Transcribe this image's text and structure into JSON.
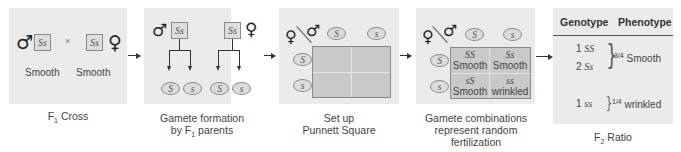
{
  "panels": {
    "f1_cross": {
      "caption_main": "F",
      "caption_sub": "1",
      "caption_rest": " Cross",
      "male_symbol": "♂",
      "female_symbol": "♀",
      "male_genotype": "Ss",
      "female_genotype": "Ss",
      "cross_sign": "×",
      "male_phenotype": "Smooth",
      "female_phenotype": "Smooth"
    },
    "gamete_formation": {
      "caption_line1": "Gamete formation",
      "caption_line2_pre": "by F",
      "caption_line2_sub": "1",
      "caption_line2_post": " parents",
      "male_symbol": "♂",
      "female_symbol": "♀",
      "male_genotype": "Ss",
      "female_genotype": "Ss",
      "male_gametes": [
        "S",
        "s"
      ],
      "female_gametes": [
        "S",
        "s"
      ]
    },
    "punnett_setup": {
      "caption_line1": "Set up",
      "caption_line2": "Punnett Square",
      "female_symbol": "♀",
      "male_symbol": "♂",
      "male_gametes": [
        "S",
        "s"
      ],
      "female_gametes": [
        "S",
        "s"
      ]
    },
    "gamete_combinations": {
      "caption_line1": "Gamete combinations",
      "caption_line2": "represent random",
      "caption_line3": "fertilization",
      "female_symbol": "♀",
      "male_symbol": "♂",
      "male_gametes": [
        "S",
        "s"
      ],
      "female_gametes": [
        "S",
        "s"
      ],
      "cells": [
        {
          "genotype": "SS",
          "phenotype": "Smooth"
        },
        {
          "genotype": "Ss",
          "phenotype": "Smooth"
        },
        {
          "genotype": "sS",
          "phenotype": "Smooth"
        },
        {
          "genotype": "ss",
          "phenotype": "wrinkled"
        }
      ]
    },
    "f2_ratio": {
      "caption_main": "F",
      "caption_sub": "2",
      "caption_rest": " Ratio",
      "headers": [
        "Genotype",
        "Phenotype"
      ],
      "rows": [
        {
          "count": "1",
          "genotype": "SS"
        },
        {
          "count": "2",
          "genotype": "Ss"
        },
        {
          "count": "1",
          "genotype": "ss"
        }
      ],
      "groups": [
        {
          "fraction": "3/4",
          "phenotype": " Smooth"
        },
        {
          "fraction": "1/4",
          "phenotype": " wrinkled"
        }
      ]
    }
  },
  "colors": {
    "panel_bg": "#ebebeb",
    "grid_bg": "#c9c9c9",
    "border": "#8a8a8a",
    "arrow": "#333333"
  }
}
